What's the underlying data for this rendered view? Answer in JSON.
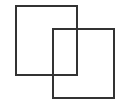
{
  "canvas": {
    "width": 119,
    "height": 102,
    "background": "#ffffff"
  },
  "shapes": [
    {
      "id": "rect-back",
      "x": 15,
      "y": 5,
      "width": 63,
      "height": 71,
      "stroke": "#333333",
      "stroke_width": 2
    },
    {
      "id": "rect-front",
      "x": 52,
      "y": 28,
      "width": 63,
      "height": 71,
      "stroke": "#333333",
      "stroke_width": 2
    }
  ]
}
